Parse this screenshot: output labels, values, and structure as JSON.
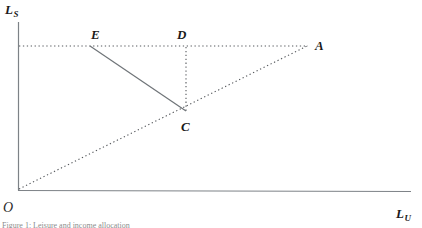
{
  "figure": {
    "background_color": "#ffffff",
    "axis_color": "#7d8287",
    "solid_line_color": "#6f7478",
    "dotted_line_color": "#55585c",
    "label_color": "#1a1a1a"
  },
  "axes": {
    "y_axis_label": "L",
    "y_axis_subscript": "S",
    "x_axis_label": "L",
    "x_axis_subscript": "U",
    "origin_label": "O",
    "y_axis_top_px": 22,
    "y_axis_bottom_px": 190,
    "x_axis_left_px": 18,
    "x_axis_right_px": 411
  },
  "points": [
    {
      "id": "E",
      "label": "E",
      "x_px": 90,
      "y_px": 46,
      "label_x_px": 91,
      "label_y_px": 28
    },
    {
      "id": "D",
      "label": "D",
      "x_px": 186,
      "y_px": 46,
      "label_x_px": 177,
      "label_y_px": 28
    },
    {
      "id": "A",
      "label": "A",
      "x_px": 307,
      "y_px": 46,
      "label_x_px": 315,
      "label_y_px": 39
    },
    {
      "id": "C",
      "label": "C",
      "x_px": 186,
      "y_px": 111,
      "label_x_px": 181,
      "label_y_px": 120
    },
    {
      "id": "O",
      "label": "O",
      "x_px": 18,
      "y_px": 190,
      "label_x_px": 3,
      "label_y_px": 201
    }
  ],
  "segments": [
    {
      "name": "horizontal-guide-E-D-A",
      "style": "dotted",
      "from": "origin-axis",
      "to": "A",
      "x1": 19,
      "y1": 46,
      "x2": 308,
      "y2": 46
    },
    {
      "name": "vertical-guide-D-C",
      "style": "dotted",
      "from": "D",
      "to": "C",
      "x1": 186,
      "y1": 47,
      "x2": 186,
      "y2": 111
    },
    {
      "name": "ray-O-C-A",
      "style": "dotted",
      "from": "O",
      "to": "A",
      "x1": 19,
      "y1": 189,
      "x2": 307,
      "y2": 46
    },
    {
      "name": "budget-line-E-C",
      "style": "solid",
      "from": "E",
      "to": "C",
      "x1": 90,
      "y1": 46,
      "x2": 186,
      "y2": 111
    }
  ],
  "caption": {
    "cropped_text": "Figure 1: Leisure and income allocation"
  }
}
